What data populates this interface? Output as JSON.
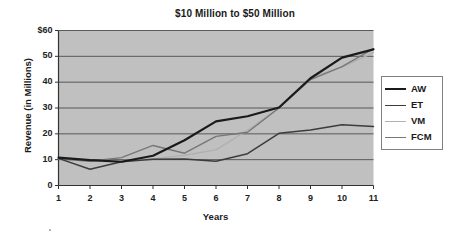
{
  "chart_data": {
    "type": "line",
    "title": "$10 Million to $50 Million",
    "xlabel": "Years",
    "ylabel": "Revenue (in Millions)",
    "x": [
      1,
      2,
      3,
      4,
      5,
      6,
      7,
      8,
      9,
      10,
      11
    ],
    "xtick_labels": [
      "1",
      "2",
      "3",
      "4",
      "5",
      "6",
      "7",
      "8",
      "9",
      "10",
      "11"
    ],
    "ytick_labels": [
      "$60",
      "50",
      "40",
      "30",
      "20",
      "10",
      "0"
    ],
    "ytick_values": [
      60,
      50,
      40,
      30,
      20,
      10,
      0
    ],
    "ylim": [
      0,
      60
    ],
    "xlim": [
      1,
      11
    ],
    "grid": "horizontal",
    "plot_background": "#c0c0c0",
    "legend_position": "right",
    "series": [
      {
        "name": "AW",
        "color": "#1a1a1a",
        "width": 2.2,
        "values": [
          10.8,
          9.8,
          9.2,
          11.5,
          17.5,
          24.8,
          26.8,
          30.2,
          41.5,
          49.5,
          52.7
        ]
      },
      {
        "name": "ET",
        "color": "#3c3c3c",
        "width": 1.5,
        "values": [
          10.5,
          6.3,
          9.2,
          10.2,
          10.3,
          9.4,
          12.3,
          20.2,
          21.5,
          23.5,
          22.8
        ]
      },
      {
        "name": "VM",
        "color": "#b0b0b0",
        "width": 1.4,
        "values": [
          10.4,
          9.5,
          9.6,
          10.3,
          11.7,
          13.8,
          21.4,
          30.1,
          41.8,
          45.8,
          51.4
        ]
      },
      {
        "name": "FCM",
        "color": "#777777",
        "width": 1.4,
        "values": [
          10.3,
          9.4,
          10.8,
          15.5,
          12.5,
          19.0,
          20.6,
          30.0,
          41.0,
          46.0,
          53.0
        ]
      }
    ]
  },
  "legend": {
    "entries": [
      {
        "label": "AW"
      },
      {
        "label": "ET"
      },
      {
        "label": "VM"
      },
      {
        "label": "FCM"
      }
    ]
  }
}
